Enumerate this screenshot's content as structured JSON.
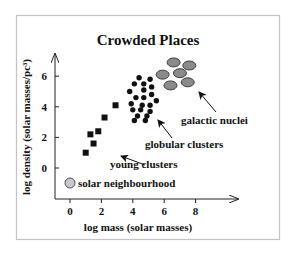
{
  "chart_data": {
    "type": "scatter",
    "title": "Crowded Places",
    "xlabel": "log mass (solar masses)",
    "ylabel": "log density (solar masses/pc³)",
    "xlim": [
      -1,
      10.5
    ],
    "ylim": [
      -2,
      7.5
    ],
    "x_ticks": [
      0,
      2,
      4,
      6,
      8
    ],
    "y_ticks": [
      0,
      2,
      4,
      6
    ],
    "grid": false,
    "legend": "none (direct annotations)",
    "series": [
      {
        "name": "young clusters",
        "marker": "square",
        "color": "#111111",
        "points": [
          [
            1.0,
            1.0
          ],
          [
            1.5,
            1.6
          ],
          [
            1.3,
            2.2
          ],
          [
            1.8,
            2.4
          ],
          [
            2.2,
            3.3
          ],
          [
            2.9,
            4.1
          ]
        ]
      },
      {
        "name": "globular clusters",
        "marker": "circle",
        "color": "#111111",
        "points": [
          [
            4.4,
            5.9
          ],
          [
            5.1,
            5.8
          ],
          [
            4.1,
            5.5
          ],
          [
            4.7,
            5.5
          ],
          [
            5.2,
            5.3
          ],
          [
            3.8,
            5.0
          ],
          [
            4.7,
            5.1
          ],
          [
            4.2,
            4.6
          ],
          [
            4.7,
            4.6
          ],
          [
            5.2,
            4.8
          ],
          [
            5.5,
            4.4
          ],
          [
            3.9,
            4.2
          ],
          [
            4.6,
            4.1
          ],
          [
            5.1,
            4.1
          ],
          [
            4.0,
            3.8
          ],
          [
            4.5,
            3.8
          ],
          [
            5.1,
            3.7
          ],
          [
            4.3,
            3.4
          ],
          [
            4.9,
            3.4
          ],
          [
            4.1,
            3.1
          ],
          [
            4.8,
            3.1
          ]
        ]
      },
      {
        "name": "galactic nuclei",
        "marker": "ellipse",
        "color": "#8a8a8a",
        "points": [
          [
            6.6,
            6.9
          ],
          [
            7.6,
            6.7
          ],
          [
            5.9,
            6.1
          ],
          [
            7.0,
            6.2
          ],
          [
            6.4,
            5.4
          ],
          [
            7.5,
            5.6
          ]
        ]
      },
      {
        "name": "solar neighbourhood",
        "marker": "circle-large",
        "color": "#c8c8c8",
        "points": [
          [
            0,
            -0.9
          ]
        ]
      }
    ],
    "annotations": [
      {
        "text": "galactic nuclei",
        "arrow_to": [
          8.3,
          4.9
        ]
      },
      {
        "text": "globular clusters",
        "arrow_to": [
          5.6,
          3.1
        ]
      },
      {
        "text": "young clusters",
        "arrow_to": [
          3.3,
          0.8
        ]
      },
      {
        "text": "solar neighbourhood",
        "arrow_to": null
      }
    ]
  }
}
